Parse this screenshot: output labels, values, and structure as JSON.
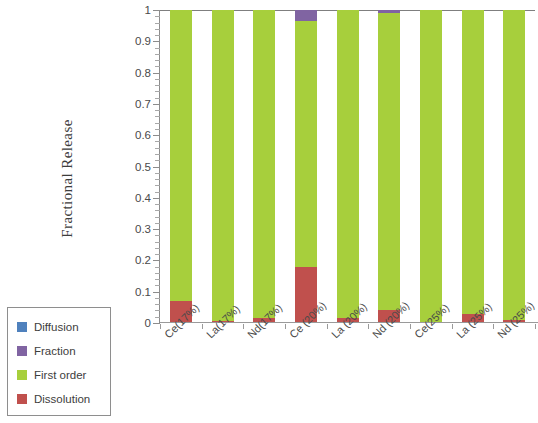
{
  "chart_data": {
    "type": "bar",
    "subtype": "stacked-bar",
    "title": "",
    "xlabel": "",
    "ylabel": "Fractional Release",
    "ylim": [
      0,
      1
    ],
    "ytick_labels": [
      "0",
      "0.1",
      "0.2",
      "0.3",
      "0.4",
      "0.5",
      "0.6",
      "0.7",
      "0.8",
      "0.9",
      "1"
    ],
    "ytick_values": [
      0,
      0.1,
      0.2,
      0.3,
      0.4,
      0.5,
      0.6,
      0.7,
      0.8,
      0.9,
      1
    ],
    "minor_tick_step": 0.02,
    "grid": false,
    "legend_position": "bottom-left",
    "categories": [
      "Ce(17%)",
      "La(17%)",
      "Nd(17%)",
      "Ce (20%)",
      "La (20%)",
      "Nd (20%)",
      "Ce(25%)",
      "La (25%)",
      "Nd (25%)"
    ],
    "series": [
      {
        "name": "Dissolution",
        "color": "#c0504d",
        "values": [
          0.07,
          0.005,
          0.015,
          0.18,
          0.015,
          0.04,
          0.0,
          0.03,
          0.01
        ]
      },
      {
        "name": "First order",
        "color": "#a7cf3c",
        "values": [
          0.93,
          0.995,
          0.985,
          0.785,
          0.985,
          0.95,
          1.0,
          0.97,
          0.99
        ]
      },
      {
        "name": "Fraction",
        "color": "#8064a2",
        "values": [
          0.0,
          0.0,
          0.0,
          0.035,
          0.0,
          0.01,
          0.0,
          0.0,
          0.0
        ]
      },
      {
        "name": "Diffusion",
        "color": "#4f81bd",
        "values": [
          0.0,
          0.0,
          0.0,
          0.0,
          0.0,
          0.0,
          0.0,
          0.0,
          0.0
        ]
      }
    ]
  },
  "legend": {
    "items": [
      {
        "label": "Diffusion",
        "color": "#4f81bd"
      },
      {
        "label": "Fraction",
        "color": "#8064a2"
      },
      {
        "label": "First order",
        "color": "#a7cf3c"
      },
      {
        "label": "Dissolution",
        "color": "#c0504d"
      }
    ]
  }
}
